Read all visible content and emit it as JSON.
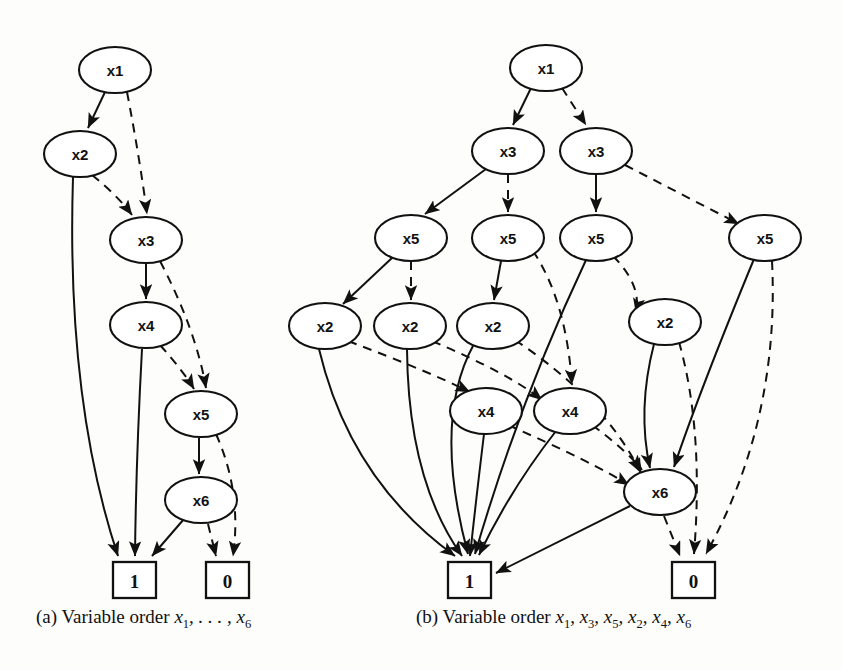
{
  "figure": {
    "type": "diagram",
    "kind": "binary-decision-diagram-pair",
    "background": "#fdfdfc",
    "ink": "#111111",
    "edge_styles": {
      "solid": "then/1-branch",
      "dashed": "else/0-branch"
    }
  },
  "captions": {
    "a": {
      "prefix": "(a) Variable order ",
      "vars": "x1, ... , x6"
    },
    "b": {
      "prefix": "(b) Variable order ",
      "vars": "x1, x3, x5, x2, x4, x6"
    }
  },
  "diagram_a": {
    "title": "(a) Variable order x1,...,x6",
    "nodes": [
      {
        "id": "a_x1",
        "label": "x1",
        "x": 115,
        "y": 70,
        "rx": 36,
        "ry": 23
      },
      {
        "id": "a_x2",
        "label": "x2",
        "x": 80,
        "y": 154,
        "rx": 36,
        "ry": 23
      },
      {
        "id": "a_x3",
        "label": "x3",
        "x": 146,
        "y": 240,
        "rx": 36,
        "ry": 23
      },
      {
        "id": "a_x4",
        "label": "x4",
        "x": 146,
        "y": 325,
        "rx": 36,
        "ry": 23
      },
      {
        "id": "a_x5",
        "label": "x5",
        "x": 201,
        "y": 414,
        "rx": 36,
        "ry": 23
      },
      {
        "id": "a_x6",
        "label": "x6",
        "x": 201,
        "y": 500,
        "rx": 36,
        "ry": 23
      }
    ],
    "terminals": [
      {
        "id": "a_T1",
        "label": "1",
        "x": 113,
        "y": 562,
        "w": 43,
        "h": 36
      },
      {
        "id": "a_T0",
        "label": "0",
        "x": 206,
        "y": 562,
        "w": 43,
        "h": 36
      }
    ],
    "edges": [
      {
        "from": "a_x1",
        "to": "a_x2",
        "style": "solid"
      },
      {
        "from": "a_x1",
        "to": "a_x3",
        "style": "dashed"
      },
      {
        "from": "a_x2",
        "to": "a_T1",
        "style": "solid"
      },
      {
        "from": "a_x2",
        "to": "a_x3",
        "style": "dashed"
      },
      {
        "from": "a_x3",
        "to": "a_x4",
        "style": "solid"
      },
      {
        "from": "a_x3",
        "to": "a_x5",
        "style": "dashed"
      },
      {
        "from": "a_x4",
        "to": "a_T1",
        "style": "solid"
      },
      {
        "from": "a_x4",
        "to": "a_x5",
        "style": "dashed"
      },
      {
        "from": "a_x5",
        "to": "a_x6",
        "style": "solid"
      },
      {
        "from": "a_x5",
        "to": "a_T0",
        "style": "dashed"
      },
      {
        "from": "a_x6",
        "to": "a_T1",
        "style": "solid"
      },
      {
        "from": "a_x6",
        "to": "a_T0",
        "style": "dashed"
      }
    ]
  },
  "diagram_b": {
    "title": "(b) Variable order x1,x3,x5,x2,x4,x6",
    "nodes": [
      {
        "id": "b_x1",
        "label": "x1",
        "x": 546,
        "y": 68,
        "rx": 36,
        "ry": 23
      },
      {
        "id": "b_x3a",
        "label": "x3",
        "x": 508,
        "y": 151,
        "rx": 36,
        "ry": 23
      },
      {
        "id": "b_x3b",
        "label": "x3",
        "x": 596,
        "y": 151,
        "rx": 36,
        "ry": 23
      },
      {
        "id": "b_x5a",
        "label": "x5",
        "x": 411,
        "y": 238,
        "rx": 36,
        "ry": 23
      },
      {
        "id": "b_x5b",
        "label": "x5",
        "x": 508,
        "y": 238,
        "rx": 36,
        "ry": 23
      },
      {
        "id": "b_x5c",
        "label": "x5",
        "x": 596,
        "y": 238,
        "rx": 36,
        "ry": 23
      },
      {
        "id": "b_x5d",
        "label": "x5",
        "x": 765,
        "y": 238,
        "rx": 36,
        "ry": 23
      },
      {
        "id": "b_x2a",
        "label": "x2",
        "x": 325,
        "y": 326,
        "rx": 36,
        "ry": 23
      },
      {
        "id": "b_x2b",
        "label": "x2",
        "x": 410,
        "y": 326,
        "rx": 36,
        "ry": 23
      },
      {
        "id": "b_x2c",
        "label": "x2",
        "x": 493,
        "y": 326,
        "rx": 36,
        "ry": 23
      },
      {
        "id": "b_x2d",
        "label": "x2",
        "x": 665,
        "y": 322,
        "rx": 36,
        "ry": 23
      },
      {
        "id": "b_x4a",
        "label": "x4",
        "x": 486,
        "y": 411,
        "rx": 36,
        "ry": 23
      },
      {
        "id": "b_x4b",
        "label": "x4",
        "x": 570,
        "y": 411,
        "rx": 36,
        "ry": 23
      },
      {
        "id": "b_x6",
        "label": "x6",
        "x": 660,
        "y": 492,
        "rx": 36,
        "ry": 23
      }
    ],
    "terminals": [
      {
        "id": "b_T1",
        "label": "1",
        "x": 448,
        "y": 562,
        "w": 43,
        "h": 36
      },
      {
        "id": "b_T0",
        "label": "0",
        "x": 672,
        "y": 562,
        "w": 43,
        "h": 36
      }
    ],
    "edges": [
      {
        "from": "b_x1",
        "to": "b_x3a",
        "style": "solid"
      },
      {
        "from": "b_x1",
        "to": "b_x3b",
        "style": "dashed"
      },
      {
        "from": "b_x3a",
        "to": "b_x5a",
        "style": "solid"
      },
      {
        "from": "b_x3a",
        "to": "b_x5b",
        "style": "dashed"
      },
      {
        "from": "b_x3b",
        "to": "b_x5c",
        "style": "solid"
      },
      {
        "from": "b_x3b",
        "to": "b_x5d",
        "style": "dashed"
      },
      {
        "from": "b_x5a",
        "to": "b_x2a",
        "style": "solid"
      },
      {
        "from": "b_x5a",
        "to": "b_x2b",
        "style": "dashed"
      },
      {
        "from": "b_x5b",
        "to": "b_x2c",
        "style": "solid"
      },
      {
        "from": "b_x5b",
        "to": "b_x4b",
        "style": "dashed"
      },
      {
        "from": "b_x5c",
        "to": "b_T1",
        "style": "solid"
      },
      {
        "from": "b_x5c",
        "to": "b_x2d",
        "style": "dashed"
      },
      {
        "from": "b_x5d",
        "to": "b_x6",
        "style": "solid"
      },
      {
        "from": "b_x5d",
        "to": "b_T0",
        "style": "dashed"
      },
      {
        "from": "b_x2a",
        "to": "b_T1",
        "style": "solid"
      },
      {
        "from": "b_x2a",
        "to": "b_x4a",
        "style": "dashed"
      },
      {
        "from": "b_x2b",
        "to": "b_T1",
        "style": "solid"
      },
      {
        "from": "b_x2b",
        "to": "b_x4b",
        "style": "dashed"
      },
      {
        "from": "b_x2c",
        "to": "b_T1",
        "style": "solid"
      },
      {
        "from": "b_x2c",
        "to": "b_x6",
        "style": "dashed"
      },
      {
        "from": "b_x2d",
        "to": "b_x6",
        "style": "solid"
      },
      {
        "from": "b_x2d",
        "to": "b_T0",
        "style": "dashed"
      },
      {
        "from": "b_x4a",
        "to": "b_T1",
        "style": "solid"
      },
      {
        "from": "b_x4a",
        "to": "b_x6",
        "style": "dashed"
      },
      {
        "from": "b_x4b",
        "to": "b_T1",
        "style": "solid"
      },
      {
        "from": "b_x4b",
        "to": "b_x6",
        "style": "dashed"
      },
      {
        "from": "b_x6",
        "to": "b_T1",
        "style": "solid"
      },
      {
        "from": "b_x6",
        "to": "b_T0",
        "style": "dashed"
      }
    ]
  }
}
